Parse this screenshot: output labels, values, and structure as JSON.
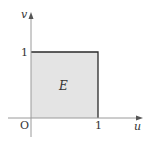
{
  "diagram": {
    "type": "region-plot",
    "axes": {
      "x_label": "u",
      "y_label": "v",
      "origin_label": "O"
    },
    "ticks": {
      "x_tick_label": "1",
      "y_tick_label": "1"
    },
    "region": {
      "label": "E",
      "shape": "unit square",
      "u_range": [
        0,
        1
      ],
      "v_range": [
        0,
        1
      ],
      "fill_color": "#e4e4e4",
      "border_color": "#2a2a2a"
    },
    "colors": {
      "axis": "#9a9a9a",
      "text": "#333333"
    }
  }
}
